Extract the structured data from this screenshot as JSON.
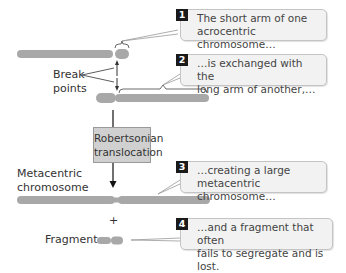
{
  "diagram": {
    "title_box": {
      "line1": "Robertsonian",
      "line2": "translocation"
    },
    "labels": {
      "break_points_line1": "Break",
      "break_points_line2": "points",
      "metacentric_line1": "Metacentric",
      "metacentric_line2": "chromosome",
      "plus": "+",
      "fragment": "Fragment"
    },
    "callouts": [
      {
        "number": "1",
        "line1": "The short arm of one",
        "line2": "acrocentric chromosome…"
      },
      {
        "number": "2",
        "line1": "…is exchanged with the",
        "line2": "long arm of another,…"
      },
      {
        "number": "3",
        "line1": "…creating a large",
        "line2": "metacentric chromosome…"
      },
      {
        "number": "4",
        "line1": "…and a fragment that often",
        "line2": "fails to segregate and is lost."
      }
    ],
    "colors": {
      "chromosome": "#a8a8a8",
      "callout_bg": "#f2f2f2",
      "number_badge": "#1a1a1a",
      "box_bg": "#d0d0d0"
    }
  }
}
